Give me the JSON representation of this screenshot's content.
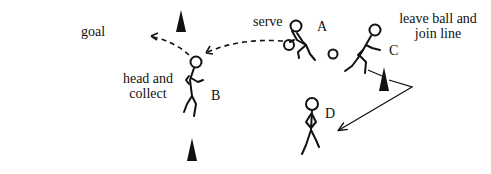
{
  "diagram": {
    "labels": {
      "goal": "goal",
      "head_collect_line1": "head and",
      "head_collect_line2": "collect",
      "serve": "serve",
      "leave_line1": "leave ball and",
      "leave_line2": "join line"
    },
    "players": [
      {
        "id": "A",
        "label": "A",
        "role": "server"
      },
      {
        "id": "B",
        "label": "B",
        "role": "header"
      },
      {
        "id": "C",
        "label": "C",
        "role": "runner"
      },
      {
        "id": "D",
        "label": "D",
        "role": "waiting"
      }
    ],
    "cones": 4,
    "colors": {
      "ink": "#111111",
      "background": "#ffffff"
    }
  }
}
